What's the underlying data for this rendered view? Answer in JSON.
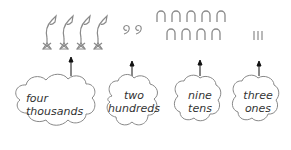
{
  "colors": {
    "glyph": "#8a8a8a",
    "cloud_stroke": "#888888",
    "arrow": "#111111",
    "text": "#333333"
  },
  "glyphs": {
    "thousands": {
      "symbol": "lotus-flower",
      "count": 4
    },
    "hundreds": {
      "symbol": "coiled-rope",
      "count": 2
    },
    "tens": {
      "symbol": "heel-bone-arch",
      "count": 9
    },
    "ones": {
      "symbol": "stroke",
      "count": 3
    }
  },
  "clouds": [
    {
      "line1": "four",
      "line2": "thousands"
    },
    {
      "line1": "two",
      "line2": "hundreds"
    },
    {
      "line1": "nine",
      "line2": "tens"
    },
    {
      "line1": "three",
      "line2": "ones"
    }
  ]
}
